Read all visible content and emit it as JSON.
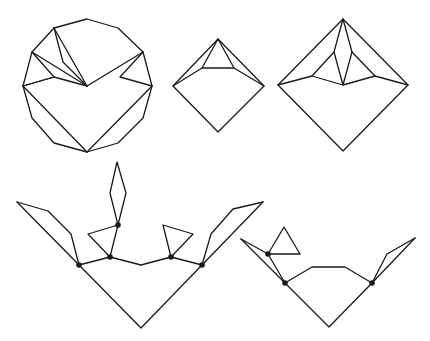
{
  "diagram": {
    "colors": {
      "stroke": "#1a1a1a",
      "background": "#ffffff"
    },
    "figures": [
      {
        "id": "dodecagon",
        "type": "polygon-triangulated",
        "vertices": 12
      },
      {
        "id": "small-diamond",
        "type": "diamond-with-inner-triangle"
      },
      {
        "id": "large-diamond",
        "type": "diamond-with-kite-and-triangles"
      },
      {
        "id": "left-v-figure",
        "type": "v-shape-with-flaps",
        "marked_points": 4
      },
      {
        "id": "right-v-figure",
        "type": "v-shape-with-flaps",
        "marked_points": 3
      }
    ]
  }
}
